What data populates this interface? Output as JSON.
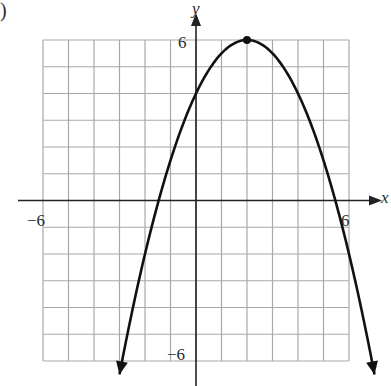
{
  "corner_mark": ")",
  "chart_data": {
    "type": "line",
    "title": "",
    "xlabel": "x",
    "ylabel": "y",
    "xlim": [
      -6,
      6
    ],
    "ylim": [
      -6,
      6
    ],
    "grid": true,
    "grid_step": 1,
    "tick_labels": {
      "x": [
        {
          "value": -6,
          "label": "−6"
        },
        {
          "value": 6,
          "label": "6"
        }
      ],
      "y": [
        {
          "value": 6,
          "label": "6"
        },
        {
          "value": -6,
          "label": "−6"
        }
      ]
    },
    "series": [
      {
        "name": "parabola",
        "equation": "y = -0.5(x - 2)^2 + 6",
        "a": -0.5,
        "h": 2,
        "k": 6,
        "x_range": [
          -3.0,
          7.0
        ],
        "arrows_at_ends": true,
        "color": "#111111"
      }
    ],
    "points": [
      {
        "label": "vertex",
        "x": 2,
        "y": 6
      }
    ],
    "key_values": {
      "vertex": [
        2,
        6
      ],
      "y_intercept": 4,
      "x_intercepts": [
        -1.46,
        5.46
      ]
    },
    "colors": {
      "grid": "#a8a8a8",
      "axis": "#222222",
      "curve": "#111111"
    }
  }
}
